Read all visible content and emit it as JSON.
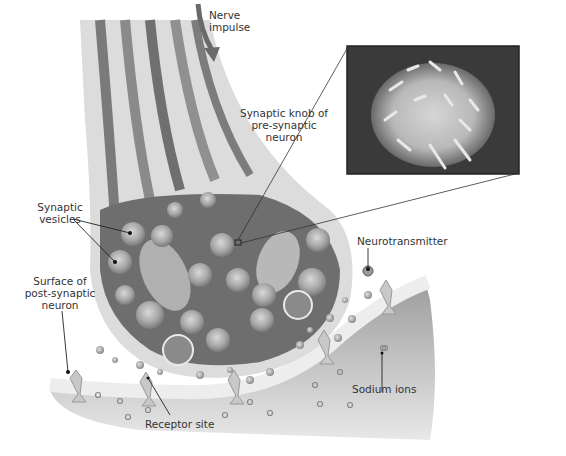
{
  "diagram": {
    "type": "labeled-illustration",
    "labels": {
      "nerve_impulse_line1": "Nerve",
      "nerve_impulse_line2": "impulse",
      "synaptic_knob_line1": "Synaptic knob of",
      "synaptic_knob_line2": "pre-synaptic",
      "synaptic_knob_line3": "neuron",
      "vesicles_line1": "Synaptic",
      "vesicles_line2": "vesicles",
      "surface_line1": "Surface of",
      "surface_line2": "post-synaptic",
      "surface_line3": "neuron",
      "neurotransmitter": "Neurotransmitter",
      "sodium_ions": "Sodium ions",
      "receptor_site": "Receptor site"
    },
    "inset": {
      "description": "Electron micrograph of a synaptic knob",
      "magnification_marker": "small square on knob"
    },
    "colors": {
      "membrane": "#d9d9d9",
      "cytoplasm": "#6e6e6e",
      "vesicle": "#9a9a9a",
      "post_synaptic": "#b5b5b5",
      "arrow": "#6a6a6a",
      "leader_line": "#222222"
    }
  }
}
